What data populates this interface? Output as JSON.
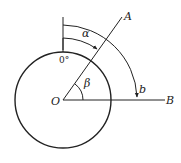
{
  "diagram": {
    "type": "angle-geometry",
    "labels": {
      "origin": "O",
      "point_a": "A",
      "point_b": "B",
      "alpha": "α",
      "beta": "β",
      "arc_b": "b",
      "zero_mark": "0°"
    },
    "colors": {
      "stroke": "#222222",
      "background": "#ffffff"
    }
  }
}
